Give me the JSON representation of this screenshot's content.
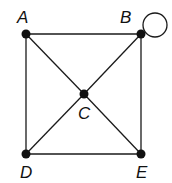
{
  "graph": {
    "nodes": [
      {
        "id": "A",
        "label": "A",
        "x": 26,
        "y": 34,
        "lx": 17,
        "ly": 23
      },
      {
        "id": "B",
        "label": "B",
        "x": 141,
        "y": 34,
        "lx": 120,
        "ly": 23
      },
      {
        "id": "C",
        "label": "C",
        "x": 84,
        "y": 94,
        "lx": 78,
        "ly": 119
      },
      {
        "id": "D",
        "label": "D",
        "x": 26,
        "y": 154,
        "lx": 20,
        "ly": 178
      },
      {
        "id": "E",
        "label": "E",
        "x": 141,
        "y": 154,
        "lx": 136,
        "ly": 178
      }
    ],
    "edges": [
      {
        "from": "A",
        "to": "B"
      },
      {
        "from": "A",
        "to": "D"
      },
      {
        "from": "A",
        "to": "C"
      },
      {
        "from": "C",
        "to": "E"
      },
      {
        "from": "B",
        "to": "C"
      },
      {
        "from": "C",
        "to": "D"
      },
      {
        "from": "B",
        "to": "E"
      },
      {
        "from": "D",
        "to": "E"
      }
    ],
    "loops": [
      {
        "node": "B",
        "cx": 155,
        "cy": 25,
        "r": 12
      }
    ],
    "colors": {
      "edge": "#1a1a1a",
      "node": "#111111",
      "background": "#ffffff"
    }
  }
}
